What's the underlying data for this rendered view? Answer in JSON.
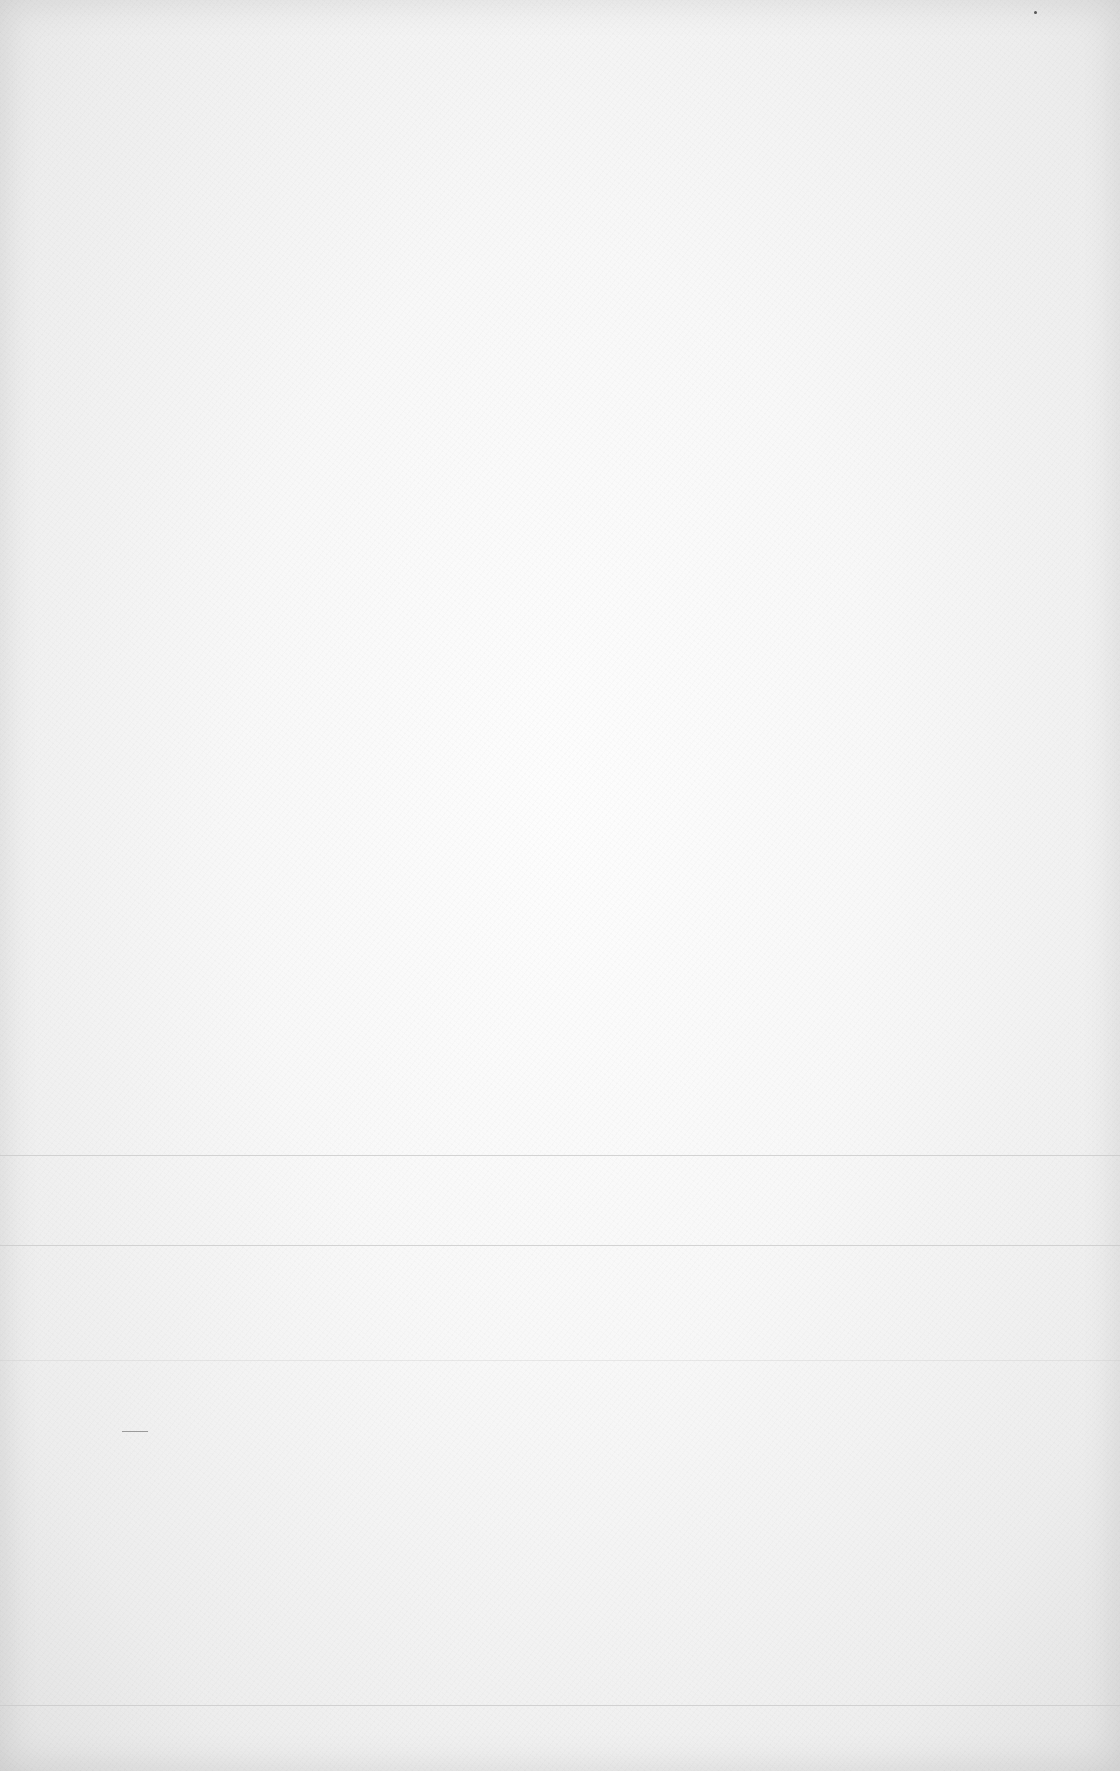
{
  "page": {
    "background_color": "#f6f6f6",
    "rule_color": "#c9c9c9"
  },
  "rules": [
    {
      "y": 1155
    },
    {
      "y": 1245
    },
    {
      "y": 1360
    },
    {
      "y": 1705
    }
  ],
  "marks": [
    {
      "type": "speck",
      "x": 1034,
      "y": 11
    },
    {
      "type": "stroke",
      "x": 122,
      "y": 1431,
      "width": 26
    }
  ]
}
